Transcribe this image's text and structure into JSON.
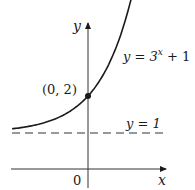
{
  "chart_data": {
    "type": "line",
    "title": "",
    "xlabel": "x",
    "ylabel": "y",
    "series": [
      {
        "name": "y = 3^x + 1",
        "function": "3^x + 1",
        "x": [
          -2.1,
          -1.5,
          -1,
          -0.5,
          0,
          0.5,
          1,
          1.1
        ],
        "values": [
          1.1,
          1.19,
          1.33,
          1.58,
          2,
          2.73,
          4,
          4.35
        ]
      }
    ],
    "asymptote": {
      "label": "y = 1",
      "value": 1,
      "style": "dashed"
    },
    "highlighted_point": {
      "label": "(0, 2)",
      "x": 0,
      "y": 2
    },
    "origin_label": "0",
    "grid": false,
    "legend": "none"
  },
  "labels": {
    "y_axis": "y",
    "x_axis": "x",
    "origin": "0",
    "point": "(0, 2)",
    "asymptote": "y = 1",
    "curve_prefix": "y = 3",
    "curve_exp": "x",
    "curve_suffix": " + 1"
  },
  "colors": {
    "curve": "#1a1a1a",
    "axes": "#333333",
    "dashed": "#333333"
  }
}
